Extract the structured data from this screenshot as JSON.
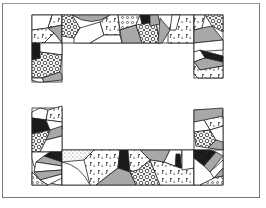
{
  "diagram": {
    "title": "",
    "colors": {
      "frame": "#777777",
      "outline": "#222222",
      "black": "#1a1a1a",
      "gray": "#a8a8a8",
      "white": "#ffffff",
      "print": "#f4f4f4"
    },
    "sections": [
      {
        "name": "top-left-corner",
        "bounds": [
          32,
          15,
          62,
          82
        ]
      },
      {
        "name": "top-band",
        "bounds": [
          62,
          15,
          194,
          43
        ]
      },
      {
        "name": "top-right-corner",
        "bounds": [
          194,
          15,
          223,
          78
        ]
      },
      {
        "name": "bottom-left-corner",
        "bounds": [
          32,
          108,
          62,
          185
        ]
      },
      {
        "name": "bottom-band",
        "bounds": [
          62,
          150,
          194,
          185
        ]
      },
      {
        "name": "bottom-right-corner",
        "bounds": [
          194,
          110,
          223,
          185
        ]
      }
    ]
  }
}
